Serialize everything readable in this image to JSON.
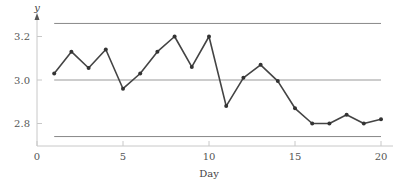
{
  "chart_data": {
    "type": "line",
    "title": "",
    "xlabel": "Day",
    "ylabel": "y",
    "xlim": [
      0,
      20
    ],
    "ylim": [
      2.68,
      3.32
    ],
    "xticks": [
      0,
      5,
      10,
      15,
      20
    ],
    "xtick_labels": [
      "0",
      "5",
      "10",
      "15",
      "20"
    ],
    "yticks": [
      2.8,
      3.0,
      3.2
    ],
    "ytick_labels": [
      "2.8",
      "3.0",
      "3.2"
    ],
    "grid": false,
    "legend": null,
    "reference_lines": [
      {
        "name": "upper-control-limit",
        "y": 3.26,
        "x_from": 1,
        "x_to": 20
      },
      {
        "name": "center-line",
        "y": 3.0,
        "x_from": 1,
        "x_to": 20
      },
      {
        "name": "lower-control-limit",
        "y": 2.74,
        "x_from": 1,
        "x_to": 20
      }
    ],
    "series": [
      {
        "name": "y",
        "x": [
          1,
          2,
          3,
          4,
          5,
          6,
          7,
          8,
          9,
          10,
          11,
          12,
          13,
          14,
          15,
          16,
          17,
          18,
          19,
          20
        ],
        "values": [
          3.03,
          3.13,
          3.055,
          3.14,
          2.96,
          3.03,
          3.13,
          3.2,
          3.06,
          3.2,
          2.88,
          3.01,
          3.07,
          2.995,
          2.87,
          2.8,
          2.8,
          2.84,
          2.8,
          2.82
        ]
      }
    ]
  }
}
